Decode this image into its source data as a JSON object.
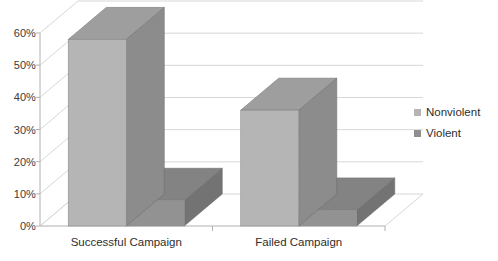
{
  "chart_data": {
    "type": "bar",
    "title": "",
    "subtitle": "",
    "xlabel": "",
    "ylabel": "",
    "categories": [
      "Successful Campaign",
      "Failed Campaign"
    ],
    "series": [
      {
        "name": "Nonviolent",
        "values": [
          58,
          36
        ],
        "color": "#b5b5b5"
      },
      {
        "name": "Violent",
        "values": [
          8,
          5
        ],
        "color": "#8f8f8f"
      }
    ],
    "ylim": [
      0,
      60
    ],
    "yticks": [
      0,
      10,
      20,
      30,
      40,
      50,
      60
    ],
    "ytick_labels": [
      "0%",
      "10%",
      "20%",
      "30%",
      "40%",
      "50%",
      "60%"
    ],
    "grid": true,
    "legend_position": "right",
    "style": "3d-column",
    "annotations": []
  },
  "legend": {
    "items": [
      {
        "label": "Nonviolent",
        "color": "#b5b5b5"
      },
      {
        "label": "Violent",
        "color": "#8f8f8f"
      }
    ]
  },
  "colors": {
    "series_nonviolent_front": "#b5b5b5",
    "series_nonviolent_side": "#8c8c8c",
    "series_nonviolent_top": "#9e9e9e",
    "series_violent_front": "#929292",
    "series_violent_side": "#737373",
    "series_violent_top": "#838383",
    "gridline": "#d7d7d7",
    "axis": "#b0b0b0",
    "text": "#2e2e2e",
    "background": "#ffffff"
  }
}
